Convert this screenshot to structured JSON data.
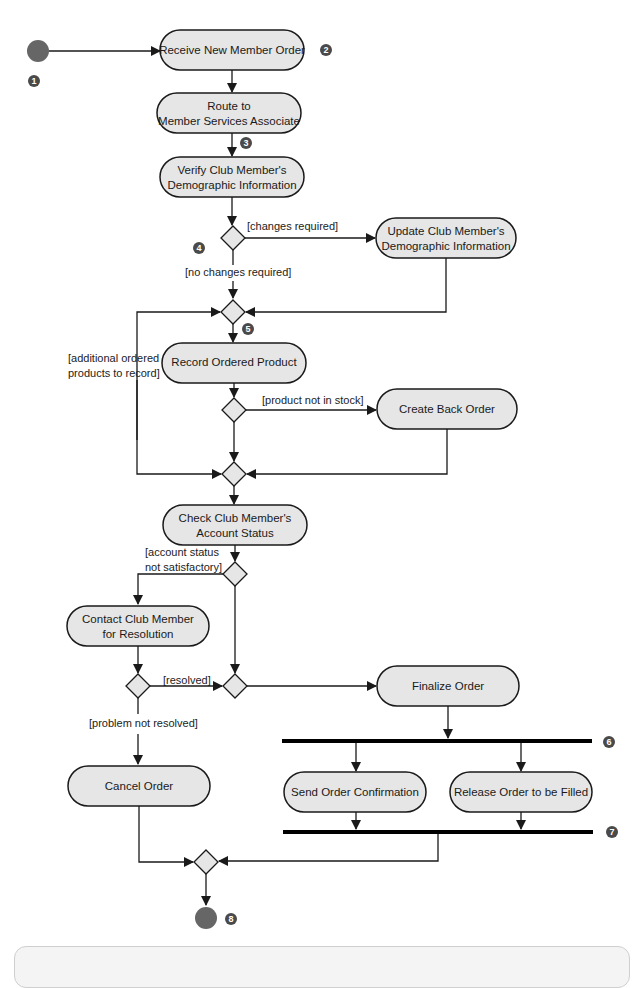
{
  "diagram": {
    "type": "UML activity diagram",
    "colors": {
      "node_fill": "#e6e6e6",
      "stroke": "#1a1a1a",
      "start_end": "#666666",
      "badge": "#4a4a4a"
    },
    "activities": {
      "receive": "Receive New Member Order",
      "route_1": "Route to",
      "route_2": "Member Services Associate",
      "verify_1": "Verify Club Member's",
      "verify_2": "Demographic Information",
      "update_1": "Update Club Member's",
      "update_2": "Demographic Information",
      "record": "Record Ordered Product",
      "backorder": "Create Back Order",
      "check_1": "Check Club Member's",
      "check_2": "Account Status",
      "contact_1": "Contact Club Member",
      "contact_2": "for Resolution",
      "cancel": "Cancel Order",
      "finalize": "Finalize Order",
      "confirm": "Send Order Confirmation",
      "release": "Release Order to be Filled"
    },
    "guards": {
      "changes": "[changes required]",
      "no_changes": "[no changes required]",
      "additional_1": "[additional ordered",
      "additional_2": "products to record]",
      "not_in_stock": "[product not in stock]",
      "account_1": "[account status",
      "account_2": "not satisfactory]",
      "resolved": "[resolved]",
      "not_resolved": "[problem not resolved]"
    },
    "badges": [
      "1",
      "2",
      "3",
      "4",
      "5",
      "6",
      "7",
      "8"
    ]
  }
}
